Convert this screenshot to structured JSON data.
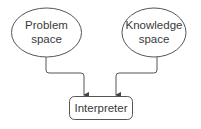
{
  "diagram": {
    "type": "flow",
    "nodes": [
      {
        "id": "problem-space",
        "shape": "ellipse",
        "lines": [
          "Problem",
          "space"
        ]
      },
      {
        "id": "knowledge-space",
        "shape": "ellipse",
        "lines": [
          "Knowledge",
          "space"
        ]
      },
      {
        "id": "interpreter",
        "shape": "rounded-rect",
        "lines": [
          "Interpreter"
        ]
      }
    ],
    "edges": [
      {
        "from": "problem-space",
        "to": "interpreter",
        "style": "orthogonal-arrow"
      },
      {
        "from": "knowledge-space",
        "to": "interpreter",
        "style": "orthogonal-arrow"
      }
    ],
    "colors": {
      "stroke": "#555555",
      "text": "#3a3a3a",
      "background": "#ffffff"
    }
  }
}
